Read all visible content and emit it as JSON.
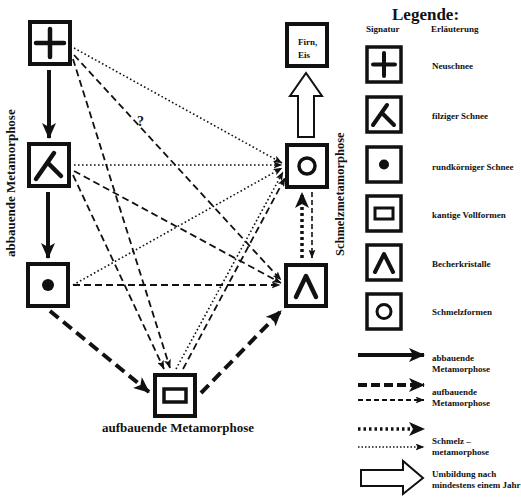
{
  "diagram": {
    "labels": {
      "left_vertical": "abbauende Metamorphose",
      "right_vertical": "Schmelzmetamorphose",
      "bottom": "aufbauende Metamorphose",
      "question_mark": "?",
      "firn_line1": "Firn,",
      "firn_line2": "Eis"
    },
    "nodes": [
      {
        "id": "neuschnee",
        "symbol": "plus-icon",
        "x": 28,
        "y": 20
      },
      {
        "id": "filziger-schnee",
        "symbol": "bent-line-icon",
        "x": 27,
        "y": 142
      },
      {
        "id": "rundkoerniger-schnee",
        "symbol": "dot-icon",
        "x": 26,
        "y": 262
      },
      {
        "id": "kantige-vollformen",
        "symbol": "rectangle-icon",
        "x": 153,
        "y": 373
      },
      {
        "id": "becherkristalle",
        "symbol": "chevron-up-icon",
        "x": 284,
        "y": 263
      },
      {
        "id": "schmelzformen",
        "symbol": "circle-icon",
        "x": 285,
        "y": 143
      },
      {
        "id": "firn-eis",
        "symbol": "text-box",
        "x": 285,
        "y": 22
      }
    ],
    "edges": [
      {
        "from": "neuschnee",
        "to": "filziger-schnee",
        "type": "abbauend-thick-solid"
      },
      {
        "from": "filziger-schnee",
        "to": "rundkoerniger-schnee",
        "type": "abbauend-thick-solid"
      },
      {
        "from": "rundkoerniger-schnee",
        "to": "kantige-vollformen",
        "type": "aufbauend-thick-dashed"
      },
      {
        "from": "kantige-vollformen",
        "to": "becherkristalle",
        "type": "aufbauend-thick-dashed"
      },
      {
        "from": "becherkristalle",
        "to": "schmelzformen",
        "type": "schmelz-thick-dotted"
      },
      {
        "from": "schmelzformen",
        "to": "becherkristalle",
        "type": "aufbauend-thin-dashed"
      },
      {
        "from": "schmelzformen",
        "to": "firn-eis",
        "type": "umbildung-hollow"
      },
      {
        "from": "neuschnee",
        "to": "schmelzformen",
        "type": "schmelz-thin-dotted"
      },
      {
        "from": "neuschnee",
        "to": "becherkristalle",
        "type": "aufbauend-thin-dashed",
        "label": "?"
      },
      {
        "from": "neuschnee",
        "to": "kantige-vollformen",
        "type": "aufbauend-thin-dashed"
      },
      {
        "from": "filziger-schnee",
        "to": "schmelzformen",
        "type": "schmelz-thin-dotted"
      },
      {
        "from": "filziger-schnee",
        "to": "becherkristalle",
        "type": "aufbauend-thin-dashed"
      },
      {
        "from": "filziger-schnee",
        "to": "kantige-vollformen",
        "type": "aufbauend-thin-dashed"
      },
      {
        "from": "rundkoerniger-schnee",
        "to": "schmelzformen",
        "type": "schmelz-thin-dotted"
      },
      {
        "from": "rundkoerniger-schnee",
        "to": "becherkristalle",
        "type": "aufbauend-thin-dashed"
      },
      {
        "from": "kantige-vollformen",
        "to": "schmelzformen",
        "type": "schmelz-thin-dotted"
      },
      {
        "from": "kantige-vollformen",
        "to": "schmelzformen",
        "type": "aufbauend-thin-dashed"
      }
    ]
  },
  "legend": {
    "title": "Legende:",
    "col_signatur": "Signatur",
    "col_erlaeuterung": "Erläuterung",
    "symbols": [
      {
        "icon": "plus-icon",
        "label": "Neuschnee"
      },
      {
        "icon": "bent-line-icon",
        "label": "filziger Schnee"
      },
      {
        "icon": "dot-icon",
        "label": "rundkörniger Schnee"
      },
      {
        "icon": "rectangle-icon",
        "label": "kantige Vollformen"
      },
      {
        "icon": "chevron-up-icon",
        "label": "Becherkristalle"
      },
      {
        "icon": "circle-icon",
        "label": "Schmelzformen"
      }
    ],
    "arrows": [
      {
        "style": "solid-thick",
        "line1": "abbauende",
        "line2": "Metamorphose"
      },
      {
        "style": "dashed",
        "line1": "aufbauende",
        "line2": "Metamorphose"
      },
      {
        "style": "dotted",
        "line1": "Schmelz –",
        "line2": "metamorphose"
      },
      {
        "style": "hollow",
        "line1": "Umbildung nach",
        "line2": "mindestens einem Jahr"
      }
    ]
  }
}
